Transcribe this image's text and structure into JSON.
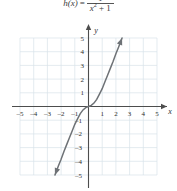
{
  "formula": {
    "function_name": "h(x)",
    "equals": "=",
    "numerator": "1",
    "denominator_base": "x",
    "denominator_exponent": "2",
    "denominator_rest": "+ 1",
    "full_text": "h(x) = 1 / (x^2 + 1)"
  },
  "chart_data": {
    "type": "line",
    "title": "",
    "xlabel": "x",
    "ylabel": "y",
    "xlim": [
      -5,
      5
    ],
    "ylim": [
      -5,
      5
    ],
    "grid": true,
    "legend": "none",
    "x_ticks": [
      -5,
      -4,
      -3,
      -2,
      -1,
      1,
      2,
      3,
      4,
      5
    ],
    "y_ticks": [
      5,
      4,
      3,
      2,
      1,
      -1,
      -2,
      -3,
      -4,
      -5
    ],
    "x_tick_labels": [
      "–5",
      "–4",
      "–3",
      "–2",
      "–1",
      "1",
      "2",
      "3",
      "4",
      "5"
    ],
    "y_tick_labels": [
      "5",
      "4",
      "3",
      "2",
      "1",
      "–1",
      "–2",
      "–3",
      "–4",
      "–5"
    ],
    "series": [
      {
        "name": "h(x)",
        "arrow_start": true,
        "arrow_end": true,
        "x": [
          -2.45,
          -2.2,
          -2.0,
          -1.8,
          -1.6,
          -1.4,
          -1.2,
          -1.0,
          -0.8,
          -0.6,
          -0.4,
          -0.2,
          0,
          0.2,
          0.4,
          0.6,
          0.8,
          1.0,
          1.2,
          1.4,
          1.6,
          1.8,
          2.0,
          2.2,
          2.45
        ],
        "y": [
          -5.0,
          -4.35,
          -3.85,
          -3.3,
          -2.8,
          -2.3,
          -1.8,
          -1.3,
          -0.9,
          -0.52,
          -0.25,
          -0.08,
          0,
          0.08,
          0.25,
          0.52,
          0.9,
          1.3,
          1.8,
          2.3,
          2.8,
          3.3,
          3.85,
          4.35,
          5.0
        ]
      }
    ]
  },
  "colors": {
    "grid": "#d9e2ea",
    "axis": "#4d4d4d",
    "curve": "#6e7276",
    "text": "#2e2e2e",
    "background": "#ffffff"
  }
}
